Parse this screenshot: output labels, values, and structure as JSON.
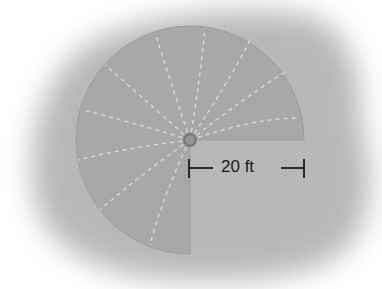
{
  "figure": {
    "sector_angle_deg": 270,
    "missing_quadrant": "bottom-right",
    "radius_label": "20 ft",
    "colors": {
      "background_blob": "#b9b9b9",
      "sector_fill": "#a9a9a9",
      "sector_edge": "#9a9a9a",
      "spray_lines": "#e6e6e6",
      "sprinkler": "#7a7a7a",
      "dimension": "#1a1a1a"
    }
  }
}
